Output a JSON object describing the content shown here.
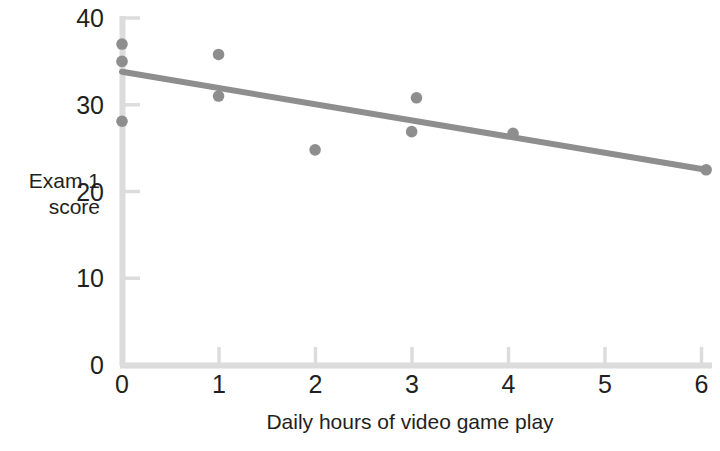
{
  "chart_data": {
    "type": "scatter",
    "title": "",
    "xlabel": "Daily hours of video game play",
    "ylabel": "Exam 1 score",
    "ylabel_lines": [
      "Exam 1",
      "score"
    ],
    "xlim": [
      0,
      6
    ],
    "ylim": [
      0,
      40
    ],
    "xticks": [
      0,
      1,
      2,
      3,
      4,
      5,
      6
    ],
    "xtick_labels": [
      "0",
      "1",
      "2",
      "3",
      "4",
      "5",
      "6"
    ],
    "yticks": [
      0,
      10,
      20,
      30,
      40
    ],
    "ytick_labels": [
      "0",
      "10",
      "20",
      "30",
      "40"
    ],
    "grid": false,
    "legend": false,
    "legend_position": "none",
    "point_color": "#8e8e8e",
    "line_color": "#8e8e8e",
    "axis_color": "#dcdcdc",
    "points": [
      {
        "x": 0.0,
        "y": 37.0
      },
      {
        "x": 0.0,
        "y": 35.0
      },
      {
        "x": 0.0,
        "y": 28.1
      },
      {
        "x": 1.0,
        "y": 35.8
      },
      {
        "x": 1.0,
        "y": 31.0
      },
      {
        "x": 2.0,
        "y": 24.8
      },
      {
        "x": 3.05,
        "y": 30.8
      },
      {
        "x": 3.0,
        "y": 26.9
      },
      {
        "x": 4.05,
        "y": 26.7
      },
      {
        "x": 6.05,
        "y": 22.5
      }
    ],
    "trendline": {
      "name": "least-squares regression line",
      "x0": 0.0,
      "y0": 33.8,
      "x1": 6.05,
      "y1": 22.5
    }
  }
}
